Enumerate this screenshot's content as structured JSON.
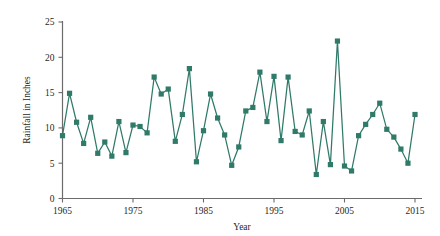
{
  "chart_data": {
    "type": "line",
    "title": "",
    "xlabel": "Year",
    "ylabel": "Rainfall in Inches",
    "xlim": [
      1965,
      2015
    ],
    "ylim": [
      0,
      25
    ],
    "xticks": [
      1965,
      1975,
      1985,
      1995,
      2005,
      2015
    ],
    "yticks": [
      0,
      5,
      10,
      15,
      20,
      25
    ],
    "grid": false,
    "legend": false,
    "marker": "square",
    "series_color": "#2f7a68",
    "axis_color": "#6b6b6b",
    "background_color": "#ffffff",
    "series": [
      {
        "name": "Rainfall",
        "x": [
          1965,
          1966,
          1967,
          1968,
          1969,
          1970,
          1971,
          1972,
          1973,
          1974,
          1975,
          1976,
          1977,
          1978,
          1979,
          1980,
          1981,
          1982,
          1983,
          1984,
          1985,
          1986,
          1987,
          1988,
          1989,
          1990,
          1991,
          1992,
          1993,
          1994,
          1995,
          1996,
          1997,
          1998,
          1999,
          2000,
          2001,
          2002,
          2003,
          2004,
          2005,
          2006,
          2007,
          2008,
          2009,
          2010,
          2011,
          2012,
          2013,
          2014,
          2015
        ],
        "values": [
          8.9,
          14.9,
          10.8,
          7.8,
          11.5,
          6.4,
          8.0,
          6.0,
          10.9,
          6.5,
          10.4,
          10.2,
          9.3,
          17.2,
          14.8,
          15.5,
          8.1,
          11.9,
          18.4,
          5.2,
          9.6,
          14.8,
          11.4,
          9.0,
          4.7,
          7.3,
          12.4,
          12.9,
          17.9,
          10.9,
          17.3,
          8.2,
          17.2,
          9.5,
          9.0,
          12.4,
          3.4,
          10.9,
          4.8,
          22.3,
          4.6,
          3.9,
          8.9,
          10.5,
          11.9,
          13.5,
          9.8,
          8.7,
          7.0,
          5.0,
          11.9
        ]
      }
    ]
  }
}
